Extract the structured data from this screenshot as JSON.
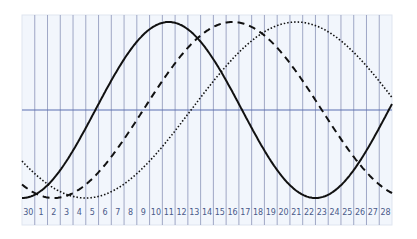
{
  "chart_data": {
    "type": "line",
    "title": "",
    "xlabel": "",
    "ylabel": "",
    "categories": [
      "30",
      "1",
      "2",
      "3",
      "4",
      "5",
      "6",
      "7",
      "8",
      "9",
      "10",
      "11",
      "12",
      "13",
      "14",
      "15",
      "16",
      "17",
      "18",
      "19",
      "20",
      "21",
      "22",
      "23",
      "24",
      "25",
      "26",
      "27",
      "28"
    ],
    "ylim": [
      -1,
      1
    ],
    "grid": {
      "vertical": true,
      "horizontal_midline": true
    },
    "legend": null,
    "series": [
      {
        "name": "solid",
        "style": "solid",
        "period_days": 23,
        "peak_day": "11",
        "trough_day": "23",
        "start_value": -0.98,
        "end_value": 0.6
      },
      {
        "name": "dashed",
        "style": "dashed",
        "period_days": 28,
        "peak_day": "16",
        "trough_day": "30",
        "start_value": -1.0,
        "end_value": -0.7
      },
      {
        "name": "dotted",
        "style": "dotted",
        "period_days": 33,
        "peak_day": "21",
        "trough_day": "4",
        "start_value": -0.7,
        "end_value": 0.15
      }
    ],
    "colors": {
      "background": "#f2f6fc",
      "gridline": "#8a93b8",
      "midline": "#5a6fb0",
      "curve": "#111111",
      "label": "#4a5a8a"
    }
  }
}
